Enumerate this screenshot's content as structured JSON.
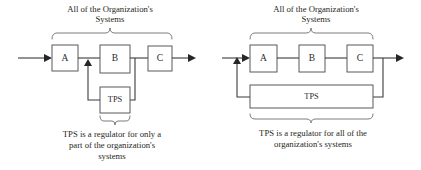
{
  "figure": {
    "background_color": "#ffffff",
    "line_color": "#3b3b3d",
    "box_stroke_color": "#58595b",
    "brace_color": "#6d6e70",
    "text_color": "#1f1f21"
  },
  "panels": [
    {
      "id": "left-panel",
      "heading_line1": "All of the Organization's",
      "heading_line2": "Systems",
      "boxes": [
        {
          "id": "box-a",
          "label": "A"
        },
        {
          "id": "box-b",
          "label": "B"
        },
        {
          "id": "box-c",
          "label": "C"
        },
        {
          "id": "box-tps",
          "label": "TPS"
        }
      ],
      "caption_line1": "TPS is a regulator for only a",
      "caption_line2": "part of the organization's",
      "caption_line3": "systems",
      "scope": "partial",
      "top_brace_spans": [
        "A",
        "B",
        "C"
      ],
      "bottom_brace_spans": [
        "TPS"
      ]
    },
    {
      "id": "right-panel",
      "heading_line1": "All of the Organization's",
      "heading_line2": "Systems",
      "boxes": [
        {
          "id": "box-a",
          "label": "A"
        },
        {
          "id": "box-b",
          "label": "B"
        },
        {
          "id": "box-c",
          "label": "C"
        },
        {
          "id": "box-tps",
          "label": "TPS"
        }
      ],
      "caption_line1": "TPS is a regulator for all of the",
      "caption_line2": "organization's systems",
      "caption_line3": "",
      "scope": "full",
      "top_brace_spans": [
        "A",
        "B",
        "C"
      ],
      "bottom_brace_spans": [
        "A",
        "B",
        "C",
        "TPS"
      ]
    }
  ]
}
